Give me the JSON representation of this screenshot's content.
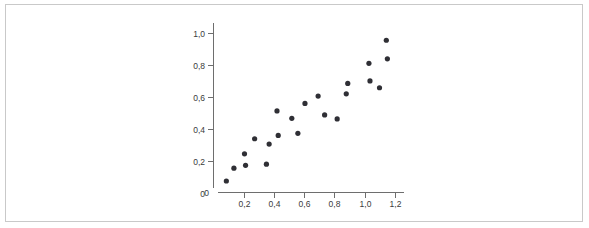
{
  "figure": {
    "background_color": "#ffffff",
    "frame_color": "#c9c9c9",
    "axis_color": "#6e6e6e",
    "label_color": "#3a3a3a",
    "point_color": "#2f2f35"
  },
  "chart_data": {
    "type": "scatter",
    "title": "",
    "subtitle": "",
    "xlabel": "",
    "ylabel": "",
    "xlim": [
      0,
      1.26
    ],
    "ylim": [
      0,
      1.06
    ],
    "grid": false,
    "legend": null,
    "legend_position": "none",
    "decimal_separator": ",",
    "x_ticks": [
      0.2,
      0.4,
      0.6,
      0.8,
      1.0,
      1.2
    ],
    "x_tick_labels": [
      "0,2",
      "0,4",
      "0,6",
      "0,8",
      "1,0",
      "1,2"
    ],
    "y_ticks": [
      0,
      0.2,
      0.4,
      0.6,
      0.8,
      1.0
    ],
    "y_tick_labels": [
      "0",
      "0,2",
      "0,4",
      "0,6",
      "0,8",
      "1,0"
    ],
    "origin_label": "0",
    "marker": "circle",
    "marker_size": 2.6,
    "points": [
      {
        "x": 0.085,
        "y": 0.072
      },
      {
        "x": 0.135,
        "y": 0.152
      },
      {
        "x": 0.205,
        "y": 0.242
      },
      {
        "x": 0.212,
        "y": 0.17
      },
      {
        "x": 0.272,
        "y": 0.336
      },
      {
        "x": 0.35,
        "y": 0.177
      },
      {
        "x": 0.368,
        "y": 0.303
      },
      {
        "x": 0.42,
        "y": 0.51
      },
      {
        "x": 0.428,
        "y": 0.357
      },
      {
        "x": 0.518,
        "y": 0.464
      },
      {
        "x": 0.558,
        "y": 0.37
      },
      {
        "x": 0.605,
        "y": 0.557
      },
      {
        "x": 0.692,
        "y": 0.603
      },
      {
        "x": 0.735,
        "y": 0.485
      },
      {
        "x": 0.818,
        "y": 0.46
      },
      {
        "x": 0.878,
        "y": 0.617
      },
      {
        "x": 0.888,
        "y": 0.682
      },
      {
        "x": 1.028,
        "y": 0.808
      },
      {
        "x": 1.035,
        "y": 0.698
      },
      {
        "x": 1.098,
        "y": 0.655
      },
      {
        "x": 1.143,
        "y": 0.952
      },
      {
        "x": 1.15,
        "y": 0.836
      }
    ]
  }
}
